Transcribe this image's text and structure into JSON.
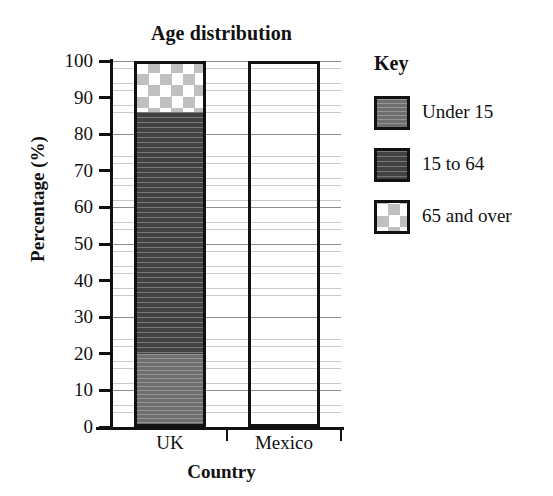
{
  "chart_data": {
    "type": "bar",
    "subtype": "stacked-bar-100-percent",
    "title": "Age distribution",
    "xlabel": "Country",
    "ylabel": "Percentage (%)",
    "categories": [
      "UK",
      "Mexico"
    ],
    "series": [
      {
        "name": "Under 15",
        "values": [
          20,
          null
        ],
        "fill": "medium-grey-solid"
      },
      {
        "name": "15 to 64",
        "values": [
          66,
          null
        ],
        "fill": "dark-grey-horizontal-stripes"
      },
      {
        "name": "65 and over",
        "values": [
          14,
          null
        ],
        "fill": "white-grey-diamond-check"
      }
    ],
    "cumulative_boundaries": {
      "UK": [
        0,
        20,
        86,
        100
      ],
      "Mexico": []
    },
    "ylim": [
      0,
      100
    ],
    "ytick_labels": [
      "0",
      "10",
      "20",
      "30",
      "40",
      "50",
      "60",
      "70",
      "80",
      "90",
      "100"
    ],
    "ytick_values": [
      0,
      10,
      20,
      30,
      40,
      50,
      60,
      70,
      80,
      90,
      100
    ],
    "minor_gridline_interval": 2,
    "grid": true,
    "legend_position": "right",
    "legend_title": "Key"
  },
  "legend": {
    "title": "Key",
    "entries": [
      {
        "label": "Under 15",
        "swatch": "medium-grey-solid"
      },
      {
        "label": "15 to 64",
        "swatch": "dark-grey-horizontal-stripes"
      },
      {
        "label": "65 and over",
        "swatch": "white-grey-diamond-check"
      }
    ]
  },
  "colors": {
    "axis": "#111111",
    "under15": "#767676",
    "age15to64": "#4a4a4a",
    "age65over": "#ffffff",
    "diamond": "#c0c0c0",
    "major_gridline": "#8d8d8d",
    "minor_gridline": "#c9c9c9",
    "background": "#ffffff"
  }
}
